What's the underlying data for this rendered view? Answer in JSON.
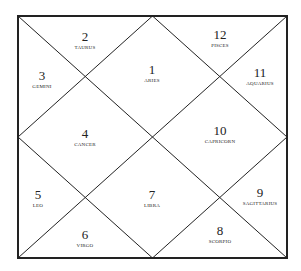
{
  "chart": {
    "style": "North Indian",
    "frame": {
      "x1": 18,
      "y1": 16,
      "x2": 287,
      "y2": 258
    },
    "line_color": "#222222"
  },
  "houses": [
    {
      "number": "1",
      "sign": "ARIES",
      "x": 152,
      "y": 73
    },
    {
      "number": "2",
      "sign": "TAURUS",
      "x": 85,
      "y": 40
    },
    {
      "number": "3",
      "sign": "GEMINI",
      "x": 42,
      "y": 79
    },
    {
      "number": "4",
      "sign": "CANCER",
      "x": 85,
      "y": 137
    },
    {
      "number": "5",
      "sign": "LEO",
      "x": 38,
      "y": 198
    },
    {
      "number": "6",
      "sign": "VIRGO",
      "x": 85,
      "y": 238
    },
    {
      "number": "7",
      "sign": "LIBRA",
      "x": 152,
      "y": 198
    },
    {
      "number": "8",
      "sign": "SCORPIO",
      "x": 220,
      "y": 234
    },
    {
      "number": "9",
      "sign": "SAGITTARIUS",
      "x": 260,
      "y": 196
    },
    {
      "number": "10",
      "sign": "CAPRICORN",
      "x": 220,
      "y": 134
    },
    {
      "number": "11",
      "sign": "AQUARIUS",
      "x": 260,
      "y": 76
    },
    {
      "number": "12",
      "sign": "PISCES",
      "x": 220,
      "y": 38
    }
  ]
}
